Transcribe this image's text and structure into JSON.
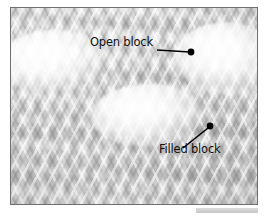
{
  "image": {
    "subject": "filet crochet fabric close-up",
    "alt": "Macro photograph of white crochet fabric showing open mesh blocks and solid filled blocks",
    "frame_border_color": "#6f6f6f",
    "background_color": "#ffffff",
    "cloth_color": "#d6d6d6",
    "highlight_color": "#ffffff"
  },
  "annotations": [
    {
      "id": "open-block",
      "label": "Open block",
      "text_color": "#111111",
      "leader_color": "#000000",
      "marker": "filled-dot",
      "marker_x": 190,
      "marker_y": 51
    },
    {
      "id": "filled-block",
      "label": "Filled block",
      "text_color": "#111111",
      "leader_color": "#000000",
      "marker": "filled-dot",
      "marker_x": 209,
      "marker_y": 125
    }
  ],
  "bottom_bar": {
    "label": "",
    "color": "#d2d2d2"
  }
}
